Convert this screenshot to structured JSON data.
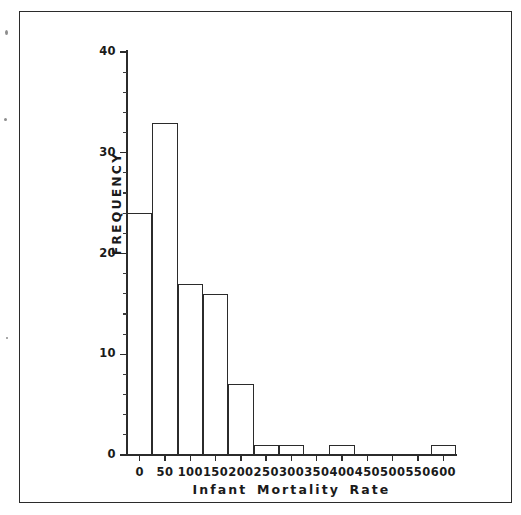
{
  "figure": {
    "background_color": "#ffffff",
    "ink_color": "#2b2b2b",
    "frame_visible": true
  },
  "chart_data": {
    "type": "bar",
    "title": "",
    "subtitle": "",
    "xlabel": "Infant Mortality Rate",
    "ylabel": "FREQUENCY",
    "xlim": [
      -25,
      625
    ],
    "ylim": [
      0,
      40
    ],
    "grid": false,
    "legend": null,
    "bar_style": "outline",
    "bin_width": 50,
    "categories": [
      "-25-25",
      "25-75",
      "75-125",
      "125-175",
      "175-225",
      "225-275",
      "275-325",
      "325-375",
      "375-425",
      "425-475",
      "475-525",
      "525-575",
      "575-625"
    ],
    "bin_centers": [
      0,
      50,
      100,
      150,
      200,
      250,
      300,
      350,
      400,
      450,
      500,
      550,
      600
    ],
    "bin_edges": [
      -25,
      25,
      75,
      125,
      175,
      225,
      275,
      325,
      375,
      425,
      475,
      525,
      575,
      625
    ],
    "values": [
      24,
      33,
      17,
      16,
      7,
      1,
      1,
      0,
      1,
      0,
      0,
      0,
      1
    ],
    "xticks": [
      0,
      50,
      100,
      150,
      200,
      250,
      300,
      350,
      400,
      450,
      500,
      550,
      600
    ],
    "xtick_labels": [
      "0",
      "50",
      "100",
      "150",
      "200",
      "250",
      "300",
      "350",
      "400",
      "450",
      "500",
      "550",
      "600"
    ],
    "yticks": [
      0,
      10,
      20,
      30,
      40
    ],
    "ytick_labels": [
      "0",
      "10",
      "20",
      "30",
      "40"
    ],
    "ytick_minor_step": 2,
    "total_count": 101
  }
}
